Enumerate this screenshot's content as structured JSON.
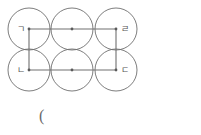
{
  "figure": {
    "stroke_color": "#6e6e6e",
    "rect_color": "#707070",
    "dot_color": "#5a5a5a",
    "background_color": "#ffffff",
    "canvas": {
      "width": 201,
      "height": 135
    }
  },
  "circles": [
    {
      "id": "top-left",
      "cx": 29,
      "cy": 29,
      "r": 21
    },
    {
      "id": "top-middle",
      "cx": 72,
      "cy": 29,
      "r": 21
    },
    {
      "id": "top-right",
      "cx": 116,
      "cy": 29,
      "r": 21
    },
    {
      "id": "bottom-left",
      "cx": 29,
      "cy": 70,
      "r": 21
    },
    {
      "id": "bottom-middle",
      "cx": 72,
      "cy": 70,
      "r": 21
    },
    {
      "id": "bottom-right",
      "cx": 116,
      "cy": 70,
      "r": 21
    }
  ],
  "center_dots": [
    {
      "id": "dot-top-left",
      "cx": 29,
      "cy": 29
    },
    {
      "id": "dot-top-middle",
      "cx": 72,
      "cy": 29
    },
    {
      "id": "dot-top-right",
      "cx": 116,
      "cy": 29
    },
    {
      "id": "dot-bottom-left",
      "cx": 29,
      "cy": 70
    },
    {
      "id": "dot-bottom-middle",
      "cx": 72,
      "cy": 70
    },
    {
      "id": "dot-bottom-right",
      "cx": 116,
      "cy": 70
    }
  ],
  "rectangle": {
    "x": 29,
    "y": 29,
    "width": 87,
    "height": 41,
    "points": "29,29 116,29 116,70 29,70 29,29"
  },
  "labels": {
    "top_left": "ㄱ",
    "bottom_left": "ㄴ",
    "bottom_right": "ㄷ",
    "top_right": "ㄹ"
  },
  "caption": {
    "text": "("
  }
}
